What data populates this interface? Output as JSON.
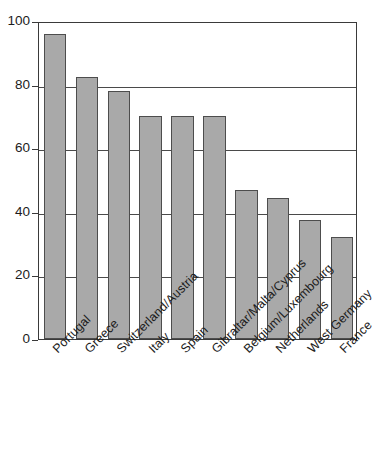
{
  "chart_data": {
    "type": "bar",
    "title": "",
    "subtitle": "",
    "xlabel": "",
    "ylabel": "",
    "ylim": [
      0,
      100
    ],
    "yticks": [
      0,
      20,
      40,
      60,
      80,
      100
    ],
    "grid": true,
    "legend": false,
    "legend_position": "none",
    "orientation": "vertical",
    "bar_color": "#a9a9a9",
    "bar_edge_color": "#4d4d4d",
    "axis_color": "#3a3a3a",
    "background_color": "#ffffff",
    "xtick_rotation": -45,
    "categories": [
      "Portugal",
      "Greece",
      "Switzerland/Austria",
      "Italy",
      "Spain",
      "Gibraltar/Malta/Cyprus",
      "Belgium/Luxembourg",
      "Netherlands",
      "West Germany",
      "France"
    ],
    "values": [
      96,
      82.5,
      78,
      70,
      70,
      70,
      47,
      44.5,
      37.5,
      32
    ],
    "series": [
      {
        "name": "",
        "values": [
          96,
          82.5,
          78,
          70,
          70,
          70,
          47,
          44.5,
          37.5,
          32
        ]
      }
    ],
    "annotations": []
  }
}
